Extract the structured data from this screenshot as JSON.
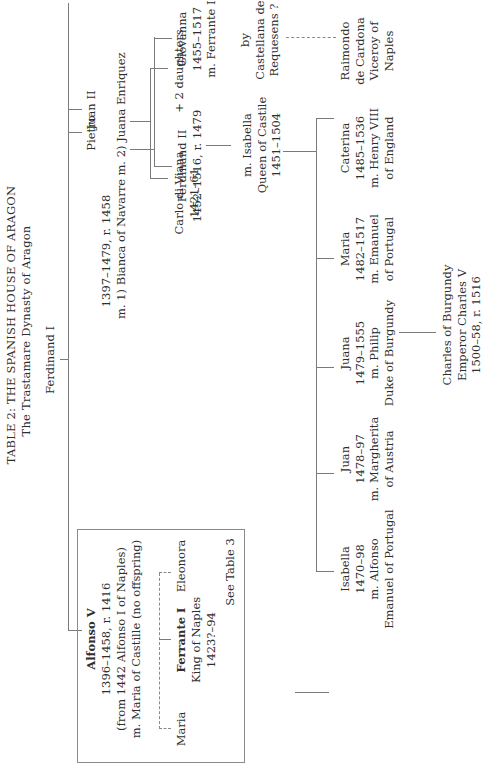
{
  "header": {
    "title": "TABLE 2: THE SPANISH HOUSE OF ARAGON",
    "subtitle": "The Trastamare Dynasty of Aragon"
  },
  "root": {
    "name": "Ferdinand I"
  },
  "gen1": {
    "alfonso": {
      "name": "Alfonso V",
      "dates": "1396–1458, r. 1416",
      "note": "(from 1442 Alfonso I of Naples)",
      "marriage": "m. Maria of Castille (no offspring)"
    },
    "juan": {
      "name": "Juan II",
      "dates": "1397–1479, r. 1458",
      "marriage1": "m. 1) Bianca of Navarre",
      "marriage2": "m. 2) Juana Enriquez"
    },
    "pietro": {
      "name": "Pietro"
    }
  },
  "alfonso_children": {
    "maria": {
      "name": "Maria"
    },
    "ferrante": {
      "name": "Ferrante I",
      "title": "King of Naples",
      "dates": "1423?–94"
    },
    "eleonora": {
      "name": "Eleonora"
    },
    "see_also": "See Table 3"
  },
  "juan_children_1": {
    "carlo": {
      "name": "Carlo di Viana",
      "dates": "1421–61"
    },
    "daughters": {
      "name": "+ 2 daughters"
    }
  },
  "juan_children_2": {
    "ferdinand": {
      "name": "Ferdinand II",
      "dates": "1452–1516, r. 1479"
    },
    "giovanna": {
      "name": "Giovanna",
      "dates": "1455–1517",
      "marriage": "m. Ferrante I"
    }
  },
  "ferdinand_spouse": {
    "line1": "m. Isabella",
    "line2": "Queen of Castile",
    "line3": "1451–1504"
  },
  "illegitimate": {
    "by1": "by",
    "by2": "Castellana de",
    "by3": "Requesens ?",
    "child1": "Raimondo",
    "child2": "de Cardona",
    "child3": "Viceroy of",
    "child4": "Naples"
  },
  "isabella_children": [
    {
      "name": "Isabella",
      "dates": "1470–98",
      "m1": "m. Alfonso",
      "m2": "Emanuel of Portugal"
    },
    {
      "name": "Juan",
      "dates": "1478–97",
      "m1": "m. Margherita",
      "m2": "of Austria"
    },
    {
      "name": "Juana",
      "dates": "1479–1555",
      "m1": "m. Philip",
      "m2": "Duke of Burgundy"
    },
    {
      "name": "Maria",
      "dates": "1482–1517",
      "m1": "m. Emanuel",
      "m2": "of Portugal"
    },
    {
      "name": "Caterina",
      "dates": "1485–1536",
      "m1": "m. Henry VIII",
      "m2": "of England"
    }
  ],
  "grandchild": {
    "line1": "Charles of Burgundy",
    "line2": "Emperor Charles V",
    "line3": "1500–58, r. 1516"
  },
  "colors": {
    "line": "#7a7a7a",
    "text": "#2e2e2e",
    "background": "#ffffff"
  }
}
